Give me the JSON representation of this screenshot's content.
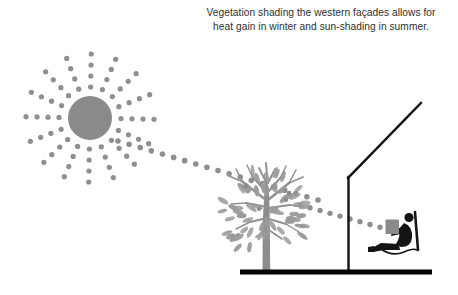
{
  "canvas": {
    "width": 458,
    "height": 295,
    "background": "#ffffff"
  },
  "caption": {
    "line1": "Vegetation shading the western façades allows for",
    "line2": "heat gain in winter and sun-shading in summer.",
    "full_text": "Vegetation shading the western façades allows for\nheat gain in winter and sun-shading in summer.",
    "color": "#2f2f2f",
    "align": "center"
  },
  "colors": {
    "sun": "#8a8a8a",
    "ray_dot": "#8f8f8f",
    "tree": "#9a9a9a",
    "tree_trunk": "#8d8d8d",
    "building_line": "#111111",
    "ground": "#050505",
    "person": "#141414",
    "book": "#8a8a8a",
    "background": "#ffffff"
  },
  "diagram": {
    "sun": {
      "label": "sun",
      "center_x": 90,
      "center_y": 118,
      "radius": 22,
      "ray_count": 16,
      "dots_per_ray": 4,
      "dot_radius": 2.6,
      "ray_inner_radius": 31,
      "ray_dot_spacing": 11
    },
    "sunbeam_to_tree": {
      "label": "solar-ray-to-tree",
      "start_x": 118,
      "start_y": 141,
      "end_x": 318,
      "end_y": 200,
      "dot_radius": 2.8,
      "dot_count": 19
    },
    "sunbeam_through_tree": {
      "label": "solar-ray-through-tree-to-person",
      "start_x": 300,
      "start_y": 205,
      "end_x": 390,
      "end_y": 230,
      "dot_radius": 2.7,
      "dot_count": 10
    },
    "tree": {
      "label": "deciduous-tree",
      "trunk_x": 266,
      "base_y": 271,
      "top_y": 163,
      "canopy_left": 222,
      "canopy_right": 313,
      "leaf_count": 64
    },
    "building": {
      "label": "building-facade-with-roof-overhang",
      "roof_apex_x": 421,
      "roof_apex_y": 103,
      "corner_x": 348,
      "corner_y": 178,
      "wall_bottom_y": 272,
      "stroke_width": 2.4
    },
    "ground": {
      "label": "ground-line",
      "x1": 240,
      "x2": 432,
      "y": 272,
      "thickness": 5
    },
    "person": {
      "label": "person-reclining-in-chair-reading",
      "x": 378,
      "y": 210,
      "width": 50,
      "height": 48
    }
  }
}
